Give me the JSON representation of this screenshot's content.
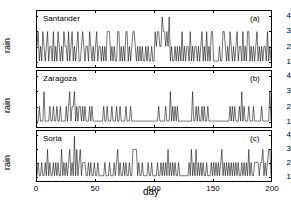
{
  "figure": {
    "xlabel": "day",
    "ylabel": "rain",
    "background": "#ffffff",
    "line_color": "#000000"
  },
  "axis": {
    "y_ticks": [
      "1",
      "2",
      "3",
      "4"
    ],
    "x_ticks": [
      "0",
      "50",
      "100",
      "150",
      "200"
    ]
  },
  "panels": {
    "a": {
      "tag": "(a)",
      "station": "Santander"
    },
    "b": {
      "tag": "(b)",
      "station": "Zaragoza"
    },
    "c": {
      "tag": "(c)",
      "station": "Soria"
    }
  },
  "chart_data": {
    "type": "line",
    "title": "",
    "xlabel": "day",
    "ylabel": "rain",
    "xlim": [
      0,
      200
    ],
    "ylim": [
      0.6,
      4.4
    ],
    "yticks": [
      1,
      2,
      3,
      4
    ],
    "xticks": [
      0,
      50,
      100,
      150,
      200
    ],
    "grid": false,
    "legend": "none",
    "subplots": [
      {
        "panel": "(a)",
        "name": "Santander",
        "x": [
          0,
          1,
          2,
          3,
          4,
          5,
          6,
          7,
          8,
          9,
          10,
          11,
          12,
          13,
          14,
          15,
          16,
          17,
          18,
          19,
          20,
          21,
          22,
          23,
          24,
          25,
          26,
          27,
          28,
          29,
          30,
          31,
          32,
          33,
          34,
          35,
          36,
          37,
          38,
          39,
          40,
          41,
          42,
          43,
          44,
          45,
          46,
          47,
          48,
          49,
          50,
          51,
          52,
          53,
          54,
          55,
          56,
          57,
          58,
          59,
          60,
          61,
          62,
          63,
          64,
          65,
          66,
          67,
          68,
          69,
          70,
          71,
          72,
          73,
          74,
          75,
          76,
          77,
          78,
          79,
          80,
          81,
          82,
          83,
          84,
          85,
          86,
          87,
          88,
          89,
          90,
          91,
          92,
          93,
          94,
          95,
          96,
          97,
          98,
          99,
          100,
          101,
          102,
          103,
          104,
          105,
          106,
          107,
          108,
          109,
          110,
          111,
          112,
          113,
          114,
          115,
          116,
          117,
          118,
          119,
          120,
          121,
          122,
          123,
          124,
          125,
          126,
          127,
          128,
          129,
          130,
          131,
          132,
          133,
          134,
          135,
          136,
          137,
          138,
          139,
          140,
          141,
          142,
          143,
          144,
          145,
          146,
          147,
          148,
          149,
          150,
          151,
          152,
          153,
          154,
          155,
          156,
          157,
          158,
          159,
          160,
          161,
          162,
          163,
          164,
          165,
          166,
          167,
          168,
          169,
          170,
          171,
          172,
          173,
          174,
          175,
          176,
          177,
          178,
          179,
          180,
          181,
          182,
          183,
          184,
          185,
          186,
          187,
          188,
          189,
          190,
          191,
          192,
          193,
          194,
          195,
          196,
          197,
          198,
          199,
          200
        ],
        "values": [
          2,
          3,
          1,
          2,
          1,
          3,
          2,
          1,
          2,
          3,
          1,
          2,
          2,
          1,
          3,
          1,
          2,
          1,
          3,
          2,
          1,
          2,
          1,
          3,
          2,
          2,
          1,
          3,
          1,
          2,
          3,
          1,
          2,
          1,
          2,
          3,
          1,
          1,
          2,
          3,
          2,
          1,
          2,
          2,
          1,
          3,
          2,
          1,
          2,
          1,
          2,
          3,
          1,
          2,
          2,
          1,
          2,
          1,
          2,
          1,
          3,
          3,
          3,
          1,
          2,
          1,
          2,
          1,
          1,
          3,
          3,
          1,
          2,
          1,
          2,
          1,
          3,
          3,
          1,
          2,
          1,
          2,
          3,
          3,
          2,
          1,
          2,
          1,
          2,
          1,
          2,
          1,
          1,
          2,
          1,
          2,
          1,
          1,
          2,
          1,
          1,
          3,
          2,
          3,
          3,
          2,
          2,
          4,
          3,
          3,
          2,
          3,
          2,
          4,
          1,
          2,
          1,
          1,
          2,
          1,
          2,
          1,
          2,
          1,
          3,
          1,
          2,
          1,
          2,
          2,
          1,
          3,
          1,
          2,
          1,
          2,
          2,
          1,
          2,
          1,
          2,
          3,
          1,
          2,
          1,
          3,
          1,
          2,
          1,
          3,
          3,
          1,
          1,
          1,
          1,
          1,
          2,
          1,
          1,
          3,
          3,
          2,
          1,
          2,
          1,
          3,
          2,
          1,
          2,
          1,
          2,
          3,
          1,
          2,
          2,
          1,
          3,
          1,
          2,
          1,
          3,
          3,
          1,
          2,
          1,
          2,
          1,
          2,
          3,
          1,
          2,
          1,
          2,
          1,
          2,
          2,
          1,
          3,
          1,
          2,
          1
        ]
      },
      {
        "panel": "(b)",
        "name": "Zaragoza",
        "x": [
          0,
          1,
          2,
          3,
          4,
          5,
          6,
          7,
          8,
          9,
          10,
          11,
          12,
          13,
          14,
          15,
          16,
          17,
          18,
          19,
          20,
          21,
          22,
          23,
          24,
          25,
          26,
          27,
          28,
          29,
          30,
          31,
          32,
          33,
          34,
          35,
          36,
          37,
          38,
          39,
          40,
          41,
          42,
          43,
          44,
          45,
          46,
          47,
          48,
          49,
          50,
          51,
          52,
          53,
          54,
          55,
          56,
          57,
          58,
          59,
          60,
          61,
          62,
          63,
          64,
          65,
          66,
          67,
          68,
          69,
          70,
          71,
          72,
          73,
          74,
          75,
          76,
          77,
          78,
          79,
          80,
          81,
          82,
          83,
          84,
          85,
          86,
          87,
          88,
          89,
          90,
          91,
          92,
          93,
          94,
          95,
          96,
          97,
          98,
          99,
          100,
          101,
          102,
          103,
          104,
          105,
          106,
          107,
          108,
          109,
          110,
          111,
          112,
          113,
          114,
          115,
          116,
          117,
          118,
          119,
          120,
          121,
          122,
          123,
          124,
          125,
          126,
          127,
          128,
          129,
          130,
          131,
          132,
          133,
          134,
          135,
          136,
          137,
          138,
          139,
          140,
          141,
          142,
          143,
          144,
          145,
          146,
          147,
          148,
          149,
          150,
          151,
          152,
          153,
          154,
          155,
          156,
          157,
          158,
          159,
          160,
          161,
          162,
          163,
          164,
          165,
          166,
          167,
          168,
          169,
          170,
          171,
          172,
          173,
          174,
          175,
          176,
          177,
          178,
          179,
          180,
          181,
          182,
          183,
          184,
          185,
          186,
          187,
          188,
          189,
          190,
          191,
          192,
          193,
          194,
          195,
          196,
          197,
          198,
          199,
          200
        ],
        "values": [
          1,
          1,
          2,
          1,
          1,
          1,
          3,
          1,
          1,
          1,
          1,
          2,
          1,
          1,
          2,
          1,
          1,
          2,
          1,
          1,
          2,
          1,
          1,
          1,
          1,
          2,
          1,
          2,
          3,
          1,
          2,
          2,
          3,
          1,
          2,
          1,
          2,
          2,
          1,
          2,
          1,
          2,
          1,
          1,
          1,
          2,
          1,
          2,
          1,
          1,
          1,
          1,
          1,
          1,
          1,
          1,
          1,
          2,
          1,
          1,
          2,
          1,
          1,
          1,
          2,
          1,
          1,
          1,
          2,
          1,
          1,
          2,
          1,
          1,
          1,
          1,
          2,
          1,
          1,
          1,
          2,
          1,
          1,
          1,
          1,
          1,
          1,
          1,
          1,
          1,
          1,
          1,
          1,
          1,
          1,
          1,
          1,
          1,
          1,
          1,
          1,
          1,
          1,
          1,
          2,
          1,
          1,
          1,
          1,
          1,
          2,
          1,
          1,
          1,
          3,
          1,
          2,
          1,
          2,
          1,
          2,
          1,
          1,
          1,
          1,
          1,
          1,
          1,
          1,
          1,
          1,
          1,
          1,
          3,
          1,
          1,
          2,
          1,
          2,
          1,
          1,
          2,
          1,
          2,
          1,
          1,
          2,
          1,
          1,
          1,
          1,
          1,
          1,
          1,
          1,
          1,
          1,
          1,
          1,
          1,
          1,
          1,
          1,
          1,
          1,
          2,
          1,
          2,
          1,
          2,
          1,
          1,
          1,
          2,
          1,
          3,
          1,
          2,
          1,
          1,
          1,
          2,
          1,
          1,
          1,
          2,
          1,
          1,
          1,
          1,
          1,
          1,
          2,
          1,
          1,
          1,
          1,
          1,
          1,
          3,
          1,
          2,
          1,
          2,
          2
        ]
      },
      {
        "panel": "(c)",
        "name": "Soria",
        "x": [
          0,
          1,
          2,
          3,
          4,
          5,
          6,
          7,
          8,
          9,
          10,
          11,
          12,
          13,
          14,
          15,
          16,
          17,
          18,
          19,
          20,
          21,
          22,
          23,
          24,
          25,
          26,
          27,
          28,
          29,
          30,
          31,
          32,
          33,
          34,
          35,
          36,
          37,
          38,
          39,
          40,
          41,
          42,
          43,
          44,
          45,
          46,
          47,
          48,
          49,
          50,
          51,
          52,
          53,
          54,
          55,
          56,
          57,
          58,
          59,
          60,
          61,
          62,
          63,
          64,
          65,
          66,
          67,
          68,
          69,
          70,
          71,
          72,
          73,
          74,
          75,
          76,
          77,
          78,
          79,
          80,
          81,
          82,
          83,
          84,
          85,
          86,
          87,
          88,
          89,
          90,
          91,
          92,
          93,
          94,
          95,
          96,
          97,
          98,
          99,
          100,
          101,
          102,
          103,
          104,
          105,
          106,
          107,
          108,
          109,
          110,
          111,
          112,
          113,
          114,
          115,
          116,
          117,
          118,
          119,
          120,
          121,
          122,
          123,
          124,
          125,
          126,
          127,
          128,
          129,
          130,
          131,
          132,
          133,
          134,
          135,
          136,
          137,
          138,
          139,
          140,
          141,
          142,
          143,
          144,
          145,
          146,
          147,
          148,
          149,
          150,
          151,
          152,
          153,
          154,
          155,
          156,
          157,
          158,
          159,
          160,
          161,
          162,
          163,
          164,
          165,
          166,
          167,
          168,
          169,
          170,
          171,
          172,
          173,
          174,
          175,
          176,
          177,
          178,
          179,
          180,
          181,
          182,
          183,
          184,
          185,
          186,
          187,
          188,
          189,
          190,
          191,
          192,
          193,
          194,
          195,
          196,
          197,
          198,
          199,
          200
        ],
        "values": [
          1,
          2,
          1,
          1,
          2,
          1,
          1,
          2,
          1,
          3,
          1,
          2,
          1,
          1,
          2,
          1,
          2,
          1,
          2,
          1,
          1,
          3,
          1,
          2,
          1,
          2,
          1,
          2,
          3,
          1,
          2,
          1,
          4,
          1,
          3,
          1,
          2,
          3,
          1,
          2,
          2,
          2,
          1,
          1,
          2,
          1,
          2,
          1,
          1,
          2,
          1,
          1,
          2,
          1,
          1,
          1,
          1,
          1,
          2,
          1,
          1,
          1,
          2,
          1,
          1,
          1,
          2,
          1,
          2,
          3,
          1,
          2,
          1,
          1,
          2,
          1,
          2,
          1,
          1,
          2,
          1,
          1,
          3,
          3,
          3,
          3,
          1,
          2,
          1,
          1,
          2,
          1,
          1,
          1,
          1,
          2,
          1,
          1,
          2,
          1,
          1,
          1,
          1,
          2,
          1,
          1,
          2,
          1,
          2,
          1,
          2,
          1,
          3,
          1,
          2,
          1,
          2,
          1,
          2,
          1,
          1,
          2,
          1,
          1,
          1,
          1,
          1,
          1,
          1,
          1,
          2,
          1,
          3,
          1,
          2,
          1,
          3,
          1,
          2,
          1,
          2,
          1,
          2,
          1,
          1,
          2,
          1,
          1,
          1,
          2,
          1,
          2,
          1,
          2,
          1,
          2,
          1,
          2,
          3,
          1,
          2,
          1,
          2,
          1,
          2,
          1,
          2,
          1,
          2,
          1,
          2,
          1,
          2,
          1,
          1,
          2,
          1,
          2,
          1,
          2,
          1,
          3,
          1,
          2,
          1,
          1,
          2,
          2,
          2,
          2,
          1,
          2,
          2,
          3,
          1,
          2,
          1,
          2,
          3,
          3,
          1
        ]
      }
    ]
  }
}
